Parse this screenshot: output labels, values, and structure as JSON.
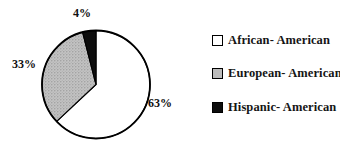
{
  "chart_data": {
    "type": "pie",
    "title": "",
    "labels": [
      "African- American",
      "European- American",
      "Hispanic- American"
    ],
    "values": [
      63,
      33,
      4
    ],
    "value_labels": [
      "63%",
      "33%",
      "4%"
    ],
    "colors": [
      "#ffffff",
      "#bcbcbc",
      "#0d0d0d"
    ],
    "textures": [
      "solid",
      "stipple",
      "solid"
    ],
    "start_angle_deg": 0,
    "direction": "clockwise",
    "legend_position": "right",
    "outline_color": "#000000",
    "background": "#ffffff",
    "label_positions": [
      {
        "x": 160,
        "y": 103
      },
      {
        "x": 24,
        "y": 64
      },
      {
        "x": 82,
        "y": 13
      }
    ]
  },
  "legend": {
    "items": [
      {
        "label": "African- American",
        "color": "#ffffff"
      },
      {
        "label": "European- American",
        "color": "#bcbcbc"
      },
      {
        "label": "Hispanic- American",
        "color": "#0d0d0d"
      }
    ]
  }
}
